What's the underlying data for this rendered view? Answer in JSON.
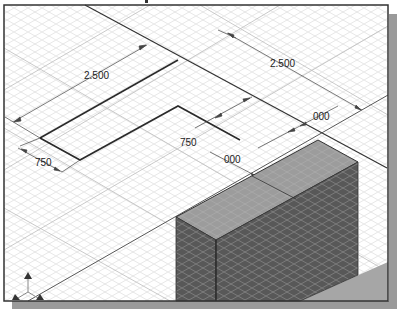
{
  "viewport": {
    "background": "#ffffff",
    "grid_color": "#d8d8d8",
    "border_color": "#333333",
    "shadow_color": "#9a9a9a"
  },
  "dimensions": [
    {
      "id": "dim-left-length",
      "label": "2.500"
    },
    {
      "id": "dim-right-length",
      "label": "2.500"
    },
    {
      "id": "dim-left-width",
      "label": ".750"
    },
    {
      "id": "dim-center-width",
      "label": ".750"
    },
    {
      "id": "dim-center-offset",
      "label": ".000"
    },
    {
      "id": "dim-right-offset",
      "label": ".000"
    }
  ],
  "display_labels": {
    "dim_left_length": "2.500",
    "dim_right_length": "2.500",
    "dim_left_width": "750",
    "dim_center_width": "750",
    "dim_center_offset": "000",
    "dim_right_offset": "000"
  },
  "solid": {
    "top_face_color": "#9b9b9b",
    "front_face_color": "#5a5a5a",
    "floor_shadow_color": "#a8a8a8"
  },
  "triad": {
    "icon": "coordinate-axes-triad-icon",
    "color": "#333333"
  }
}
